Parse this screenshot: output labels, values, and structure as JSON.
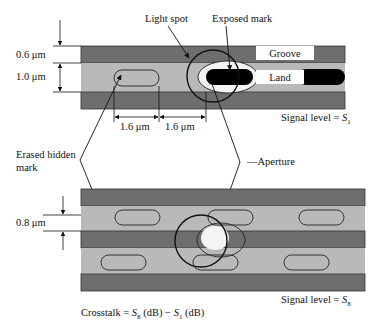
{
  "diagram": {
    "type": "optical-disc-crosstalk",
    "top_panel": {
      "dimension_groove_width": "0.6 μm",
      "dimension_land_width": "1.0 μm",
      "spacing_1": "1.6 μm",
      "spacing_2": "1.6 μm",
      "label_light_spot": "Light spot",
      "label_exposed_mark": "Exposed mark",
      "label_groove": "Groove",
      "label_land": "Land",
      "signal_level_prefix": "Signal level = ",
      "signal_level_symbol": "S",
      "signal_level_sub": "1"
    },
    "middle_labels": {
      "erased_hidden_mark_line1": "Erased hidden",
      "erased_hidden_mark_line2": "mark",
      "aperture": "Aperture"
    },
    "bottom_panel": {
      "dimension_track_pitch": "0.8 μm",
      "signal_level_prefix": "Signal level = ",
      "signal_level_symbol": "S",
      "signal_level_sub": "8"
    },
    "formula": {
      "prefix": "Crosstalk = ",
      "term1_symbol": "S",
      "term1_sub": "8",
      "term1_unit": " (dB) − ",
      "term2_symbol": "S",
      "term2_sub": "1",
      "term2_unit": " (dB)"
    },
    "colors": {
      "groove": "#6e6e6e",
      "land": "#b9b9b9",
      "mark": "#000000",
      "aperture": "#f4f4f4"
    }
  }
}
